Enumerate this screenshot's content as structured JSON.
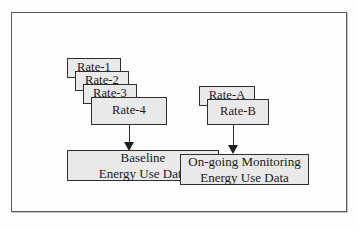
{
  "diagram": {
    "colors": {
      "box_fill": "#e9e9e9",
      "box_border": "#2e2e2e",
      "frame_border": "#5d5d5d",
      "page_background": "#fdfdfd",
      "arrow": "#1f1f1f"
    },
    "left_stack": {
      "name": "baseline-rate-stack",
      "boxes": [
        {
          "label": "Rate-1"
        },
        {
          "label": "Rate-2"
        },
        {
          "label": "Rate-3"
        },
        {
          "label": "Rate-4"
        }
      ]
    },
    "right_stack": {
      "name": "ongoing-rate-stack",
      "boxes": [
        {
          "label": "Rate-A"
        },
        {
          "label": "Rate-B"
        }
      ]
    },
    "bars": [
      {
        "name": "baseline-energy-use-data",
        "line1": "Baseline",
        "line2": "Energy Use Data"
      },
      {
        "name": "ongoing-monitoring-energy-use-data",
        "line1": "On-going Monitoring",
        "line2": "Energy Use Data"
      }
    ],
    "arrows": [
      {
        "name": "arrow-rate4-to-baseline",
        "direction": "down"
      },
      {
        "name": "arrow-rateb-to-ongoing",
        "direction": "down"
      }
    ]
  }
}
